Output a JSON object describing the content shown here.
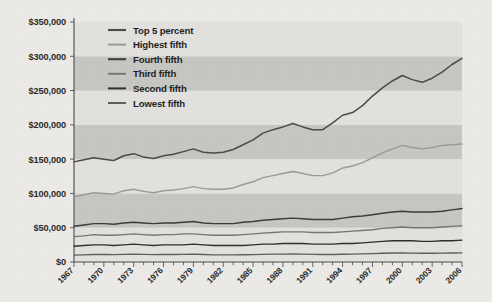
{
  "figure": {
    "background_color": "#eceae7",
    "plot_band_light": "#e2e1dd",
    "plot_band_dark": "#c6c6c2",
    "axis_color": "#4a4a4a"
  },
  "chart_data": {
    "type": "line",
    "title": "",
    "xlabel": "",
    "ylabel": "",
    "xlim": [
      1967,
      2006
    ],
    "ylim": [
      0,
      350000
    ],
    "ytick_values": [
      0,
      50000,
      100000,
      150000,
      200000,
      250000,
      300000,
      350000
    ],
    "ytick_labels": [
      "$0",
      "$50,000",
      "$100,000",
      "$150,000",
      "$200,000",
      "$250,000",
      "$300,000",
      "$350,000"
    ],
    "xtick_labels": [
      "1967",
      "1970",
      "1973",
      "1976",
      "1979",
      "1982",
      "1985",
      "1988",
      "1991",
      "1994",
      "1997",
      "2000",
      "2003",
      "2006"
    ],
    "xtick_step_years": 3,
    "minor_tick_step_years": 1,
    "grid": "alternating-horizontal-bands",
    "legend_position": "upper-left-inside",
    "x": [
      1967,
      1968,
      1969,
      1970,
      1971,
      1972,
      1973,
      1974,
      1975,
      1976,
      1977,
      1978,
      1979,
      1980,
      1981,
      1982,
      1983,
      1984,
      1985,
      1986,
      1987,
      1988,
      1989,
      1990,
      1991,
      1992,
      1993,
      1994,
      1995,
      1996,
      1997,
      1998,
      1999,
      2000,
      2001,
      2002,
      2003,
      2004,
      2005,
      2006
    ],
    "series": [
      {
        "name": "Top 5 percent",
        "color": "#4a4a4a",
        "width": 1.5,
        "values": [
          146000,
          149000,
          152000,
          150000,
          148000,
          155000,
          158000,
          153000,
          151000,
          155000,
          157000,
          161000,
          165000,
          160000,
          159000,
          160000,
          164000,
          171000,
          178000,
          188000,
          193000,
          197000,
          202000,
          197000,
          193000,
          193000,
          203000,
          214000,
          218000,
          228000,
          242000,
          254000,
          264000,
          272000,
          266000,
          262000,
          268000,
          277000,
          288000,
          297000
        ]
      },
      {
        "name": "Highest fifth",
        "color": "#9a9a96",
        "width": 1.4,
        "values": [
          95000,
          98000,
          101000,
          100000,
          99000,
          104000,
          106000,
          103000,
          101000,
          104000,
          105000,
          107000,
          110000,
          107000,
          106000,
          106000,
          108000,
          113000,
          117000,
          123000,
          126000,
          129000,
          132000,
          129000,
          126000,
          126000,
          130000,
          137000,
          140000,
          145000,
          152000,
          159000,
          165000,
          170000,
          167000,
          165000,
          167000,
          170000,
          171000,
          172000
        ]
      },
      {
        "name": "Fourth fifth",
        "color": "#3b3b3b",
        "width": 1.45,
        "values": [
          52000,
          54000,
          56000,
          56000,
          55000,
          57000,
          58000,
          57000,
          56000,
          57000,
          57000,
          58000,
          59000,
          57000,
          56000,
          56000,
          56000,
          58000,
          59000,
          61000,
          62000,
          63000,
          64000,
          63000,
          62000,
          62000,
          62000,
          64000,
          66000,
          67000,
          69000,
          71000,
          73000,
          74000,
          73000,
          73000,
          73000,
          74000,
          76000,
          78000
        ]
      },
      {
        "name": "Third fifth",
        "color": "#757572",
        "width": 1.35,
        "values": [
          37000,
          38000,
          40000,
          39000,
          39000,
          40000,
          41000,
          40000,
          39000,
          40000,
          40000,
          41000,
          41000,
          40000,
          39000,
          39000,
          39000,
          40000,
          41000,
          42000,
          43000,
          44000,
          44000,
          44000,
          43000,
          43000,
          43000,
          44000,
          45000,
          46000,
          47000,
          49000,
          50000,
          51000,
          50000,
          50000,
          50000,
          51000,
          52000,
          53000
        ]
      },
      {
        "name": "Second fifth",
        "color": "#2e2e2e",
        "width": 1.35,
        "values": [
          23000,
          24000,
          25000,
          25000,
          24000,
          25000,
          26000,
          25000,
          24000,
          25000,
          25000,
          25000,
          26000,
          25000,
          24000,
          24000,
          24000,
          24000,
          25000,
          26000,
          26000,
          27000,
          27000,
          27000,
          26000,
          26000,
          26000,
          27000,
          27000,
          28000,
          29000,
          30000,
          31000,
          31000,
          31000,
          30000,
          30000,
          31000,
          31000,
          32000
        ]
      },
      {
        "name": "Lowest fifth",
        "color": "#5e5e5c",
        "width": 1.35,
        "values": [
          10000,
          10500,
          11000,
          11000,
          10800,
          11200,
          11500,
          11200,
          10800,
          11000,
          11000,
          11200,
          11400,
          10900,
          10500,
          10400,
          10400,
          10600,
          10800,
          11200,
          11400,
          11600,
          11800,
          11500,
          11200,
          11000,
          11000,
          11300,
          11600,
          11900,
          12300,
          12700,
          13100,
          13300,
          13000,
          12800,
          12700,
          12900,
          13100,
          13300
        ]
      }
    ]
  }
}
